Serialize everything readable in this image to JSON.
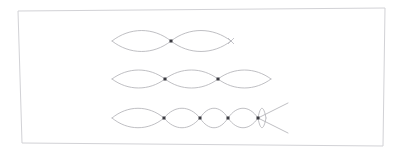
{
  "canvas": {
    "width": 400,
    "height": 156,
    "background_color": "#ffffff"
  },
  "frame": {
    "name": "slide-border",
    "stroke_color": "#d2d2d6",
    "stroke_width": 1,
    "points": "18,11 385,8 383,146 22,143"
  },
  "style": {
    "curve_color": "#aeaeb4",
    "curve_width": 0.8,
    "node_color": "#3a3a40",
    "node_size": 3.0
  },
  "caption": "Three standing wave patterns (harmonics) on a string, drawn as overlapping envelope curves with node markers at the crossing points.",
  "chart_data": {
    "type": "line",
    "subtitle": "",
    "xlabel": "",
    "ylabel": "",
    "grid": false,
    "legend": "none",
    "xlim": [
      100,
      300
    ],
    "ylim": [
      0,
      156
    ],
    "annotations": [],
    "series": [
      {
        "name": "harmonic-2",
        "label": "Second harmonic (2 loops, 1 interior node)",
        "loops": 2,
        "interior_nodes": 1,
        "axis_y": 41,
        "x_start": 112,
        "x_end": 231,
        "amplitude": 14,
        "node_x": [
          171
        ],
        "end_marker_x": [
          231
        ],
        "has_crossing_tail": false
      },
      {
        "name": "harmonic-3",
        "label": "Third harmonic (3 loops, 2 interior nodes)",
        "loops": 3,
        "interior_nodes": 2,
        "axis_y": 79,
        "x_start": 112,
        "x_end": 271,
        "amplitude": 12,
        "node_x": [
          165,
          218
        ],
        "end_marker_x": [],
        "has_crossing_tail": false
      },
      {
        "name": "harmonic-5",
        "label": "Higher harmonic (uneven loops, 4 interior nodes) with crossing tail",
        "loops": 5,
        "interior_nodes": 4,
        "axis_y": 118,
        "x_start": 112,
        "x_end": 266,
        "amplitude": 13,
        "node_x": [
          164,
          200,
          228,
          258
        ],
        "end_marker_x": [],
        "has_crossing_tail": true,
        "tail": {
          "from_x": 258,
          "to_x": 288,
          "up_to_y": 103,
          "down_to_y": 133
        }
      }
    ]
  }
}
